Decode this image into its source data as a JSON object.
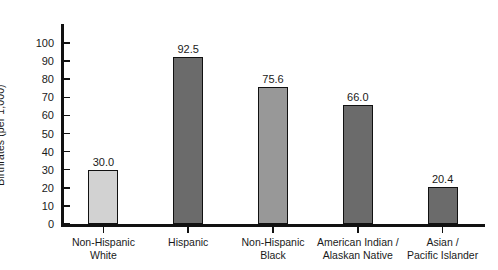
{
  "chart_data": {
    "type": "bar",
    "title": "",
    "xlabel": "",
    "ylabel": "Birthrates (per 1,000)",
    "ylim": [
      0,
      100
    ],
    "ytick_step": 10,
    "yticks": [
      0,
      10,
      20,
      30,
      40,
      50,
      60,
      70,
      80,
      90,
      100
    ],
    "ytick_labels": [
      "0",
      "10",
      "20",
      "30",
      "40",
      "50",
      "60",
      "70",
      "80",
      "90",
      "100"
    ],
    "grid": false,
    "legend": false,
    "categories": [
      "Non-Hispanic White",
      "Hispanic",
      "Non-Hispanic Black",
      "American Indian / Alaskan Native",
      "Asian / Pacific Islander"
    ],
    "category_lines": [
      [
        "Non-Hispanic",
        "White"
      ],
      [
        "Hispanic",
        ""
      ],
      [
        "Non-Hispanic",
        "Black"
      ],
      [
        "American Indian /",
        "Alaskan Native"
      ],
      [
        "Asian /",
        "Pacific Islander"
      ]
    ],
    "values": [
      30.0,
      92.5,
      75.6,
      66.0,
      20.4
    ],
    "value_labels": [
      "30.0",
      "92.5",
      "75.6",
      "66.0",
      "20.4"
    ],
    "bar_colors": [
      "#d2d2d2",
      "#6b6b6b",
      "#989898",
      "#6b6b6b",
      "#6b6b6b"
    ],
    "bar_edge_color": "#111111",
    "axis_color": "#111111",
    "background_color": "#ffffff"
  }
}
